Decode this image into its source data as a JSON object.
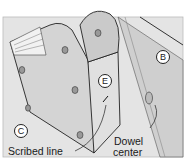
{
  "diagram": {
    "callouts": {
      "b": "B",
      "c": "C",
      "e": "E"
    },
    "labels": {
      "scribed_line": "Scribed line",
      "dowel_center_line1": "Dowel",
      "dowel_center_line2": "center"
    },
    "colors": {
      "background": "#e6e6e6",
      "part_face": "#c8c8c8",
      "part_front": "#d9d9d9",
      "outline": "#222222"
    }
  }
}
